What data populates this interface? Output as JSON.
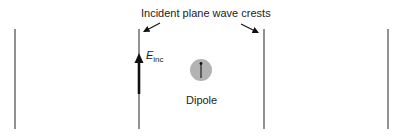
{
  "diagram": {
    "title": "Incident plane wave crests",
    "field_label": {
      "symbol": "E",
      "subscript": "inc"
    },
    "dipole_label": "Dipole",
    "wave_crests": [
      {
        "x": 15,
        "y1": 29,
        "y2": 129
      },
      {
        "x": 139,
        "y1": 29,
        "y2": 129
      },
      {
        "x": 264,
        "y1": 29,
        "y2": 129
      },
      {
        "x": 388,
        "y1": 29,
        "y2": 129
      }
    ],
    "pointer_arrows": [
      {
        "from": [
          160,
          23
        ],
        "to": [
          143,
          32
        ],
        "target": "crest-2"
      },
      {
        "from": [
          241,
          24
        ],
        "to": [
          259,
          33
        ],
        "target": "crest-3"
      }
    ],
    "field_vector": {
      "x": 139,
      "y_tail": 94,
      "y_head": 55,
      "direction": "up"
    },
    "dipole": {
      "cx": 201,
      "cy": 70,
      "r": 11,
      "fill": "#b3b3b3",
      "moment_direction": "up"
    },
    "colors": {
      "line": "#555555",
      "arrow": "#111111",
      "dipole_fill": "#b3b3b3",
      "text": "#222222"
    }
  }
}
